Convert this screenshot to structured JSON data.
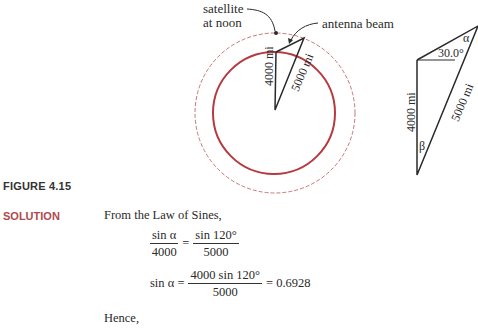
{
  "figure": {
    "label": "FIGURE 4.15",
    "left_diagram": {
      "satellite_label_line1": "satellite",
      "satellite_label_line2": "at noon",
      "antenna_label": "antenna beam",
      "side_vertical": "4000 mi",
      "side_diagonal": "5000 mi",
      "colors": {
        "earth_circle": "#b5393f",
        "orbit_circle": "#c8767a",
        "lines": "#2a2a2a"
      }
    },
    "right_diagram": {
      "angle_label": "30.0°",
      "alpha": "α",
      "beta": "β",
      "side_vertical": "4000 mi",
      "side_diagonal": "5000 mi"
    }
  },
  "solution": {
    "heading": "SOLUTION",
    "intro": "From the Law of Sines,",
    "eq1": {
      "lhs_num": "sin α",
      "lhs_den": "4000",
      "equals": "=",
      "rhs_num": "sin 120°",
      "rhs_den": "5000"
    },
    "eq2": {
      "lhs": "sin α =",
      "num": "4000 sin 120°",
      "den": "5000",
      "result": "= 0.6928"
    },
    "hence": "Hence,"
  },
  "colors": {
    "accent": "#b1484c",
    "text": "#2a2a2a"
  }
}
